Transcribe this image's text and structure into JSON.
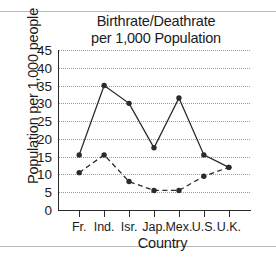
{
  "chart_data": {
    "type": "line",
    "title": "Birthrate/Deathrate per 1,000 Population",
    "title_lines": [
      "Birthrate/Deathrate",
      "per 1,000 Population"
    ],
    "xlabel": "Country",
    "ylabel": "Population per 1,000 people",
    "categories": [
      "Fr.",
      "Ind.",
      "Isr.",
      "Jap.",
      "Mex.",
      "U.S.",
      "U.K."
    ],
    "ylim": [
      0,
      45
    ],
    "yticks": [
      0,
      5,
      10,
      15,
      20,
      25,
      30,
      35,
      40,
      45
    ],
    "ytick_labels": [
      "0",
      "5",
      "10",
      "15",
      "20",
      "25",
      "30",
      "35",
      "40",
      "45"
    ],
    "grid": "horizontal-dotted",
    "legend": "none",
    "marker": "filled-circle",
    "series": [
      {
        "name": "Birthrate",
        "style": "solid",
        "color": "#2a2a2a",
        "values": [
          15.5,
          35,
          30,
          17.5,
          31.5,
          15.5,
          12
        ]
      },
      {
        "name": "Deathrate",
        "style": "dashed",
        "color": "#2a2a2a",
        "values": [
          10.5,
          15.5,
          8,
          5.5,
          5.5,
          9.5,
          12
        ]
      }
    ]
  }
}
